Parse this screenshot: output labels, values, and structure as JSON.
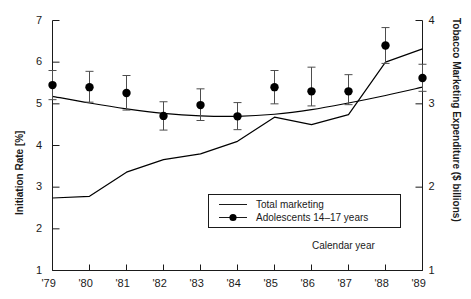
{
  "chart_data": {
    "type": "line",
    "title": "",
    "xlabel": "Calendar year",
    "x": [
      1979,
      1980,
      1981,
      1982,
      1983,
      1984,
      1985,
      1986,
      1987,
      1988,
      1989
    ],
    "xticklabels": [
      "'79",
      "'80",
      "'81",
      "'82",
      "'83",
      "'84",
      "'85",
      "'86",
      "'87",
      "'88",
      "'89"
    ],
    "grid": false,
    "legend_position": "inside-lower-right",
    "axes": {
      "left": {
        "label": "Initiation Rate [%]",
        "ylim": [
          1,
          7
        ],
        "ticks": [
          1,
          2,
          3,
          4,
          5,
          6,
          7
        ],
        "ticklabels": [
          "1",
          "2",
          "3",
          "4",
          "5",
          "6",
          "7"
        ]
      },
      "right": {
        "label": "Tobacco Marketing Expenditure ($ billions)",
        "ylim": [
          1,
          4
        ],
        "ticks": [
          1,
          2,
          3,
          4
        ],
        "ticklabels": [
          "1",
          "2",
          "3",
          "4"
        ]
      }
    },
    "series": [
      {
        "name": "Total marketing",
        "legend_label": "Total marketing",
        "axis": "right",
        "style": "line",
        "color": "#000000",
        "values": [
          1.87,
          1.89,
          2.18,
          2.33,
          2.4,
          2.55,
          2.84,
          2.75,
          2.87,
          3.5,
          3.66
        ]
      },
      {
        "name": "Adolescents 14-17 years smoking initiation (fitted curve)",
        "legend_label": "",
        "axis": "left",
        "style": "line",
        "color": "#000000",
        "values": [
          5.18,
          5.02,
          4.88,
          4.77,
          4.71,
          4.7,
          4.75,
          4.86,
          5.02,
          5.2,
          5.4
        ]
      },
      {
        "name": "Adolescents 14-17 years",
        "legend_label": "Adolescents 14–17 years",
        "axis": "left",
        "style": "marker-errorbar",
        "color": "#000000",
        "values": [
          5.45,
          5.4,
          5.26,
          4.71,
          4.97,
          4.7,
          5.4,
          5.3,
          5.3,
          6.4,
          5.62
        ],
        "err_low": [
          5.1,
          5.04,
          4.85,
          4.37,
          4.6,
          4.38,
          5.0,
          4.95,
          4.98,
          5.97,
          5.3
        ],
        "err_high": [
          5.8,
          5.78,
          5.68,
          5.05,
          5.36,
          5.03,
          5.8,
          5.88,
          5.7,
          6.83,
          5.95
        ]
      }
    ],
    "legend": [
      {
        "label": "Total marketing",
        "marker": "line"
      },
      {
        "label": "Adolescents 14–17 years",
        "marker": "line-dot"
      }
    ]
  }
}
